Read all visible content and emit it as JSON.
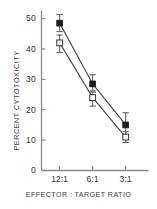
{
  "chart_data": {
    "type": "line",
    "title": "",
    "xlabel": "EFFECTOR : TARGET  RATIO",
    "ylabel": "PERCENT  CYTOTOXICITY",
    "categories": [
      "12:1",
      "6:1",
      "3:1"
    ],
    "xtick_labels": [
      "12:1",
      "6:1",
      "3:1"
    ],
    "ytick_labels": [
      "0",
      "10",
      "20",
      "30",
      "40",
      "50"
    ],
    "yticks": [
      0,
      10,
      20,
      30,
      40,
      50
    ],
    "ylim": [
      0,
      52
    ],
    "grid": false,
    "legend": "none",
    "series": [
      {
        "name": "filled-square-series",
        "marker": "filled-square",
        "values": [
          48.5,
          28.5,
          15.0
        ],
        "err_low": [
          2.8,
          2.3,
          3.2
        ],
        "err_high": [
          2.8,
          3.0,
          4.0
        ]
      },
      {
        "name": "open-square-series",
        "marker": "open-square",
        "values": [
          42.0,
          24.0,
          11.0
        ],
        "err_low": [
          3.2,
          2.8,
          1.8
        ],
        "err_high": [
          2.6,
          1.8,
          1.8
        ]
      }
    ],
    "colors": {
      "axis": "#8a8a8a",
      "line": "#4a4a4a",
      "marker_fill": "#1a1a1a",
      "marker_open_fill": "#ffffff",
      "text": "#2f2f2f"
    }
  }
}
